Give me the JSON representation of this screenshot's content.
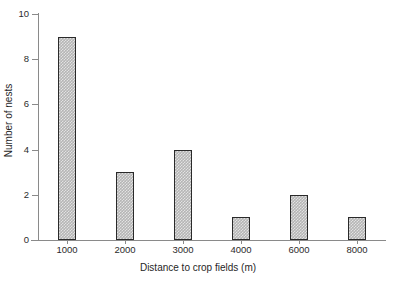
{
  "chart_data": {
    "type": "bar",
    "title": "",
    "xlabel": "Distance to crop fields (m)",
    "ylabel": "Number of nests",
    "categories": [
      "1000",
      "2000",
      "3000",
      "4000",
      "6000",
      "8000"
    ],
    "values": [
      9,
      3,
      4,
      1,
      2,
      1
    ],
    "ylim": [
      0,
      10
    ],
    "ytick_labels": [
      "0",
      "2",
      "4",
      "6",
      "8",
      "10"
    ],
    "ytick_values": [
      0,
      2,
      4,
      6,
      8,
      10
    ],
    "grid": false,
    "legend": null,
    "bar_color": "#b5b5b5",
    "bar_edge_color": "#2a2a2a",
    "axis_color": "#8a8a8a"
  }
}
